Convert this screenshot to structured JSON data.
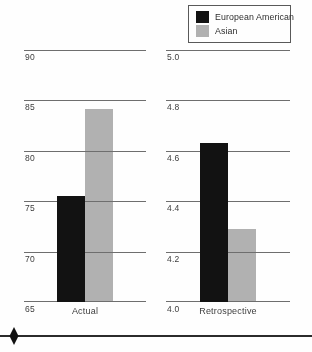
{
  "legend": {
    "items": [
      {
        "label": "European American",
        "color": "#121212"
      },
      {
        "label": "Asian",
        "color": "#b1b1b1"
      }
    ]
  },
  "chart_data": [
    {
      "type": "bar",
      "category": "Actual",
      "series": [
        {
          "name": "European American",
          "value": 75.5,
          "color": "#121212"
        },
        {
          "name": "Asian",
          "value": 84.1,
          "color": "#b1b1b1"
        }
      ],
      "ylim": [
        65,
        90
      ],
      "yticks": [
        "90",
        "85",
        "80",
        "75",
        "70",
        "65"
      ],
      "grid": true,
      "legend_position": "top-right"
    },
    {
      "type": "bar",
      "category": "Retrospective",
      "series": [
        {
          "name": "European American",
          "value": 4.63,
          "color": "#121212"
        },
        {
          "name": "Asian",
          "value": 4.29,
          "color": "#b1b1b1"
        }
      ],
      "ylim": [
        4.0,
        5.0
      ],
      "yticks": [
        "5.0",
        "4.8",
        "4.6",
        "4.4",
        "4.2",
        "4.0"
      ],
      "grid": true,
      "legend_position": "top-right"
    }
  ]
}
